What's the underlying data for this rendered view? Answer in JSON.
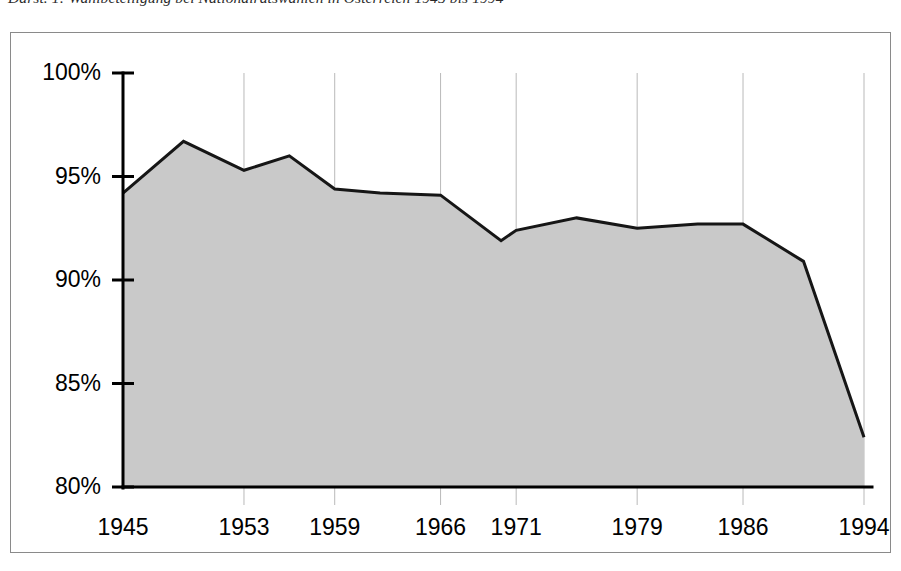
{
  "caption": {
    "text": "Darst. 1: Wahlbeteiligung bei Nationalratswahlen in Österreich 1945 bis 1994"
  },
  "chart_data": {
    "type": "area",
    "title": "Wahlbeteiligung bei Nationalratswahlen in Österreich 1945 bis 1994",
    "xlabel": "",
    "ylabel": "",
    "ylim": [
      80,
      100
    ],
    "xlim": [
      1945,
      1994
    ],
    "grid": "vertical-light",
    "legend": "none",
    "y_ticks": [
      80,
      85,
      90,
      95,
      100
    ],
    "y_tick_labels": [
      "80%",
      "85%",
      "90%",
      "95%",
      "100%"
    ],
    "x_tick_labels": [
      "1945",
      "1953",
      "1959",
      "1966",
      "1971",
      "1979",
      "1986",
      "1994"
    ],
    "x_tick_years": [
      1945,
      1953,
      1959,
      1966,
      1971,
      1979,
      1986,
      1994
    ],
    "x": [
      1945,
      1949,
      1953,
      1956,
      1959,
      1962,
      1966,
      1970,
      1971,
      1975,
      1979,
      1983,
      1986,
      1990,
      1994
    ],
    "values": [
      94.2,
      96.7,
      95.3,
      96.0,
      94.4,
      94.2,
      94.1,
      91.9,
      92.4,
      93.0,
      92.5,
      92.7,
      92.7,
      90.9,
      82.4
    ],
    "series": [
      {
        "name": "Wahlbeteiligung",
        "values": [
          94.2,
          96.7,
          95.3,
          96.0,
          94.4,
          94.2,
          94.1,
          91.9,
          92.4,
          93.0,
          92.5,
          92.7,
          92.7,
          90.9,
          82.4
        ]
      }
    ],
    "colors": {
      "area_fill": "#c9c9c9",
      "line": "#161616",
      "axis": "#000000",
      "grid": "#b9b9b9",
      "frame": "#8a8a8a"
    }
  }
}
